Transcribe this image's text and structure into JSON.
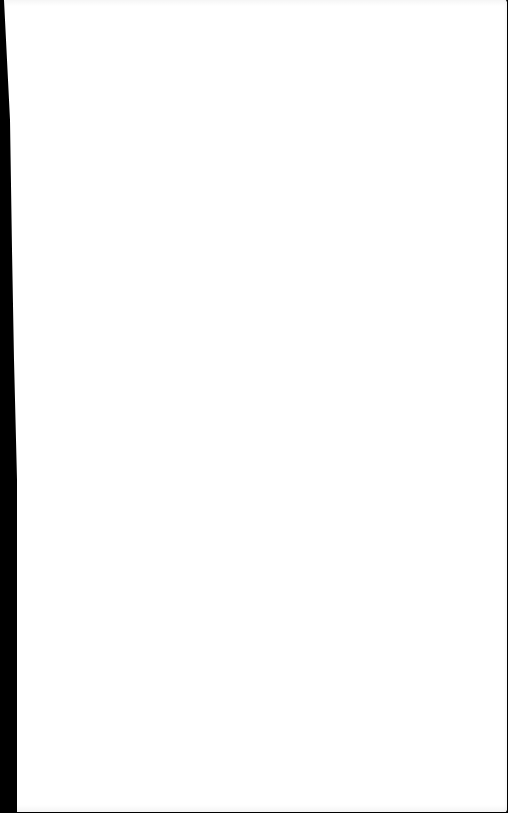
{
  "document": {
    "type": "blank-page",
    "text": "",
    "colors": {
      "paper": "#ffffff",
      "background": "#000000"
    }
  }
}
